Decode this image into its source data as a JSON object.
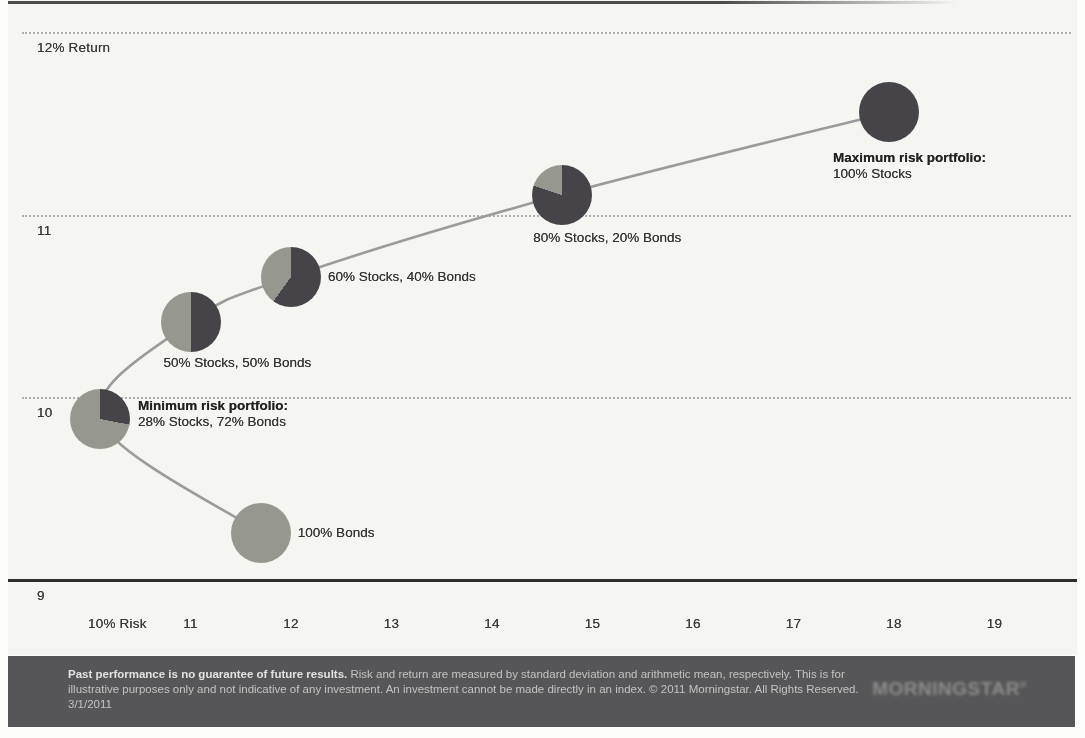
{
  "page": {
    "footer": {
      "disclaimer_bold": "Past performance is no guarantee of future results.",
      "disclaimer_rest": " Risk and return are measured by standard deviation and arithmetic mean, respectively. This is for illustrative purposes only and not indicative of any investment. An investment cannot be made directly in an index. © 2011 Morningstar. All Rights Reserved. 3/1/2011",
      "logo_text": "MORNINGSTAR",
      "logo_registered_mark": "®"
    },
    "colors": {
      "stocks_slice": "#464448",
      "bonds_slice": "#96988f",
      "curve": "#9b9b9b",
      "axis": "#2d2d2d",
      "gridline": "#a2a2a2",
      "chart_bg": "#f5f5f2",
      "footer_bg": "#565658"
    }
  },
  "chart_data": {
    "type": "scatter",
    "xlabel": "Risk (standard deviation, %)",
    "ylabel": "Return (arithmetic mean, %)",
    "xlim": [
      9.1,
      19.9
    ],
    "ylim": [
      9,
      12.2
    ],
    "grid": "horizontal-dotted",
    "legend": "none",
    "x_ticks": [
      {
        "label": "10% Risk",
        "value": 10
      },
      {
        "label": "11",
        "value": 11
      },
      {
        "label": "12",
        "value": 12
      },
      {
        "label": "13",
        "value": 13
      },
      {
        "label": "14",
        "value": 14
      },
      {
        "label": "15",
        "value": 15
      },
      {
        "label": "16",
        "value": 16
      },
      {
        "label": "17",
        "value": 17
      },
      {
        "label": "18",
        "value": 18
      },
      {
        "label": "19",
        "value": 19
      }
    ],
    "y_ticks": [
      {
        "label": "12% Return",
        "value": 12,
        "line": "dotted"
      },
      {
        "label": "11",
        "value": 11,
        "line": "dotted"
      },
      {
        "label": "10",
        "value": 10,
        "line": "dotted"
      },
      {
        "label": "9",
        "value": 9,
        "line": "solid"
      }
    ],
    "points": [
      {
        "id": "bonds-100",
        "stocks_pct": 0,
        "bonds_pct": 100,
        "risk": 11.7,
        "return": 9.26,
        "label_lines": [
          {
            "text": "100% Bonds",
            "bold": false
          }
        ]
      },
      {
        "id": "min-risk",
        "stocks_pct": 28,
        "bonds_pct": 72,
        "risk": 10.1,
        "return": 9.88,
        "label_lines": [
          {
            "text": "Minimum risk portfolio:",
            "bold": true
          },
          {
            "text": "28% Stocks, 72% Bonds",
            "bold": false
          }
        ]
      },
      {
        "id": "mix-50-50",
        "stocks_pct": 50,
        "bonds_pct": 50,
        "risk": 11.0,
        "return": 10.41,
        "label_lines": [
          {
            "text": "50% Stocks, 50% Bonds",
            "bold": false
          }
        ]
      },
      {
        "id": "mix-60-40",
        "stocks_pct": 60,
        "bonds_pct": 40,
        "risk": 12.0,
        "return": 10.66,
        "label_lines": [
          {
            "text": "60% Stocks, 40% Bonds",
            "bold": false
          }
        ]
      },
      {
        "id": "mix-80-20",
        "stocks_pct": 80,
        "bonds_pct": 20,
        "risk": 14.7,
        "return": 11.11,
        "label_lines": [
          {
            "text": "80% Stocks, 20% Bonds",
            "bold": false
          }
        ]
      },
      {
        "id": "max-risk",
        "stocks_pct": 100,
        "bonds_pct": 0,
        "risk": 17.95,
        "return": 11.56,
        "label_lines": [
          {
            "text": "Maximum risk portfolio:",
            "bold": true
          },
          {
            "text": "100% Stocks",
            "bold": false
          }
        ]
      }
    ],
    "curve_order": [
      "bonds-100",
      "min-risk",
      "mix-50-50",
      "mix-60-40",
      "mix-80-20",
      "max-risk"
    ]
  }
}
